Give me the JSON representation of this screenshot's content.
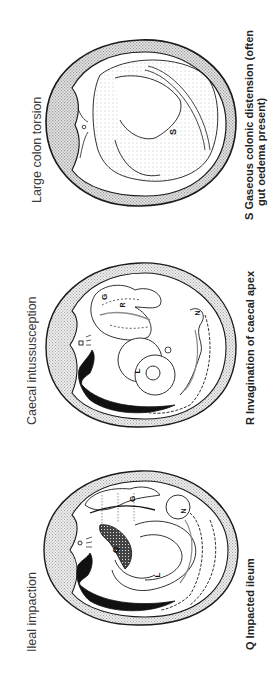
{
  "figure": {
    "orientation": "rotated 90° counter-clockwise",
    "panels": [
      {
        "id": "ileal-impaction",
        "title": "Ileal impaction",
        "caption": "Q Impacted ileum",
        "labels": [
          "G",
          "Q",
          "L",
          "N"
        ]
      },
      {
        "id": "caecal-intussusception",
        "title": "Caecal intussusception",
        "caption": "R Invagination of caecal apex",
        "labels": [
          "G",
          "R",
          "L",
          "N"
        ]
      },
      {
        "id": "large-colon-torsion",
        "title": "Large colon torsion",
        "caption_lines": [
          "S  Gaseous colonic distension (often",
          "gut oedema present)"
        ],
        "labels": [
          "S"
        ]
      }
    ]
  },
  "colors": {
    "ink": "#1a1a1a",
    "stipple": "#c8c8c8",
    "background": "#ffffff"
  }
}
